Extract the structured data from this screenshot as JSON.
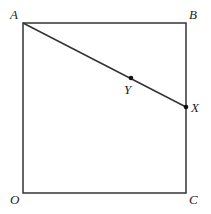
{
  "diagram": {
    "type": "geometry-square-with-segment",
    "colors": {
      "stroke": "#333333",
      "point": "#111111",
      "label": "#222222",
      "background": "#ffffff"
    },
    "vertices": [
      {
        "name": "A",
        "x": 23,
        "y": 23,
        "label_x": 10,
        "label_y": 19
      },
      {
        "name": "B",
        "x": 186,
        "y": 23,
        "label_x": 189,
        "label_y": 19
      },
      {
        "name": "C",
        "x": 186,
        "y": 193,
        "label_x": 189,
        "label_y": 204
      },
      {
        "name": "O",
        "x": 23,
        "y": 193,
        "label_x": 10,
        "label_y": 204
      }
    ],
    "segment": {
      "from": "A",
      "to": "X"
    },
    "points": [
      {
        "name": "Y",
        "x": 131,
        "y": 78,
        "label_x": 124,
        "label_y": 94
      },
      {
        "name": "X",
        "x": 186,
        "y": 107,
        "label_x": 191,
        "label_y": 112
      }
    ]
  }
}
